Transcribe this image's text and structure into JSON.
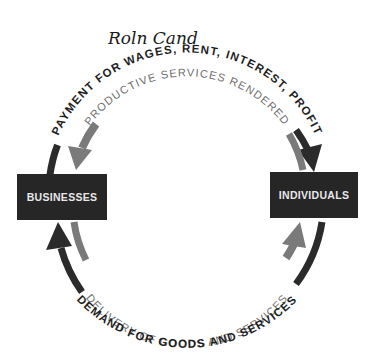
{
  "diagram": {
    "handwriting": {
      "text": "Roln  Cand"
    },
    "nodes": [
      {
        "id": "businesses",
        "label": "BUSINESSES"
      },
      {
        "id": "individuals",
        "label": "INDIVIDUALS"
      }
    ],
    "flows": [
      {
        "id": "payment",
        "label": "PAYMENT FOR WAGES, RENT, INTEREST, PROFIT",
        "from": "businesses",
        "to": "individuals",
        "position": "top-outer",
        "shade": "dark"
      },
      {
        "id": "productive_services",
        "label": "PRODUCTIVE SERVICES RENDERED",
        "from": "individuals",
        "to": "businesses",
        "position": "top-inner",
        "shade": "gray"
      },
      {
        "id": "delivery",
        "label": "DELIVERY OF GOODS AND SERVICES",
        "from": "businesses",
        "to": "individuals",
        "position": "bottom-inner",
        "shade": "gray"
      },
      {
        "id": "demand",
        "label": "DEMAND FOR GOODS AND SERVICES",
        "from": "individuals",
        "to": "businesses",
        "position": "bottom-outer",
        "shade": "dark"
      }
    ],
    "colors": {
      "dark_arrow": "#2b2b2b",
      "gray_arrow": "#7a7a7a",
      "box_fill": "#262626",
      "box_text": "#e8e8e8",
      "outer_text": "#1e1e1e",
      "inner_text": "#6e6e6e"
    }
  }
}
